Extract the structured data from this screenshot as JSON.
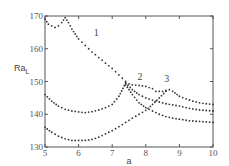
{
  "chart_data": {
    "type": "scatter",
    "title": "",
    "xlabel": "a",
    "ylabel": "Ra_L",
    "xlim": [
      5,
      10
    ],
    "ylim": [
      130,
      170
    ],
    "xticks": [
      5,
      6,
      7,
      8,
      9,
      10
    ],
    "yticks": [
      130,
      140,
      150,
      160,
      170
    ],
    "grid": false,
    "legend": null,
    "annotations": [
      {
        "text": "1",
        "x": 6.45,
        "y": 164
      },
      {
        "text": "2",
        "x": 7.75,
        "y": 150.5
      },
      {
        "text": "3",
        "x": 8.55,
        "y": 150
      }
    ],
    "series": [
      {
        "name": "1",
        "x": [
          5.0,
          5.1,
          5.2,
          5.3,
          5.4,
          5.5,
          5.6,
          5.7,
          5.8,
          5.9,
          6.0,
          6.1,
          6.2,
          6.3,
          6.4,
          6.5,
          6.6,
          6.7,
          6.8,
          6.9,
          7.0,
          7.1,
          7.2,
          7.3,
          7.4
        ],
        "y": [
          169.0,
          167.5,
          167.0,
          166.5,
          167.0,
          168.0,
          169.5,
          168.0,
          166.0,
          164.5,
          163.0,
          162.0,
          161.0,
          160.0,
          159.0,
          158.2,
          157.3,
          156.5,
          155.6,
          154.8,
          154.0,
          153.0,
          152.0,
          151.0,
          150.0
        ]
      },
      {
        "name": "upper-branch",
        "x": [
          7.4,
          7.6,
          7.8,
          8.0,
          8.2,
          8.3,
          8.5,
          8.7,
          8.8,
          9.0,
          9.2,
          9.4,
          9.6,
          9.8,
          10.0
        ],
        "y": [
          149.5,
          149.0,
          148.8,
          148.5,
          147.8,
          147.0,
          147.0,
          147.5,
          147.0,
          145.5,
          144.7,
          144.0,
          143.5,
          143.2,
          143.0
        ]
      },
      {
        "name": "middle",
        "x": [
          5.0,
          5.2,
          5.4,
          5.6,
          5.8,
          6.0,
          6.2,
          6.4,
          6.6,
          6.8,
          7.0,
          7.2,
          7.4,
          7.6,
          7.8,
          8.0,
          8.3,
          8.6,
          9.0,
          9.3,
          9.6,
          10.0
        ],
        "y": [
          146.0,
          144.0,
          142.5,
          141.5,
          141.0,
          140.7,
          140.5,
          140.8,
          141.3,
          142.0,
          143.0,
          145.5,
          149.5,
          147.5,
          146.0,
          145.0,
          144.0,
          143.2,
          142.5,
          141.8,
          141.3,
          141.0
        ]
      },
      {
        "name": "lower",
        "x": [
          5.0,
          5.2,
          5.4,
          5.6,
          5.8,
          6.0,
          6.2,
          6.4,
          6.6,
          6.8,
          7.0,
          7.2,
          7.4,
          7.6,
          7.8,
          8.0,
          8.2,
          8.4,
          8.6
        ],
        "y": [
          136.0,
          134.5,
          133.3,
          132.5,
          132.0,
          132.0,
          132.0,
          132.3,
          133.0,
          134.0,
          135.0,
          136.2,
          137.5,
          138.8,
          140.0,
          141.2,
          143.0,
          145.0,
          147.0
        ]
      },
      {
        "name": "steep-branch",
        "x": [
          7.4,
          7.6,
          7.8,
          8.0,
          8.2,
          8.4,
          8.6,
          8.8,
          9.0,
          9.3,
          9.6,
          10.0
        ],
        "y": [
          149.0,
          146.0,
          143.5,
          142.0,
          141.0,
          140.0,
          139.3,
          138.8,
          138.5,
          138.0,
          137.8,
          137.5
        ]
      }
    ]
  }
}
